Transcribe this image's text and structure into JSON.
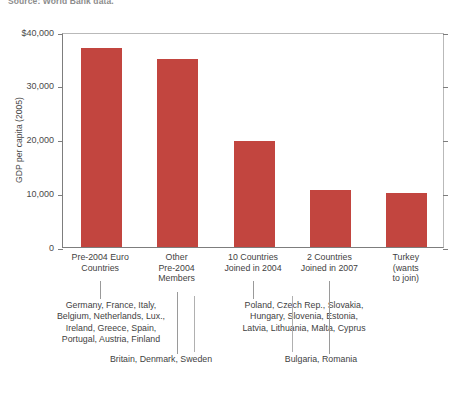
{
  "source": {
    "text": "Source: World Bank data."
  },
  "chart_data": {
    "type": "bar",
    "title": "",
    "subtitle": "",
    "xlabel": "",
    "ylabel": "GDP per capita (2005)",
    "ylim": [
      0,
      40000
    ],
    "grid": false,
    "legend": null,
    "bar_color": "#c2453f",
    "y_ticks": [
      {
        "value": 40000,
        "label": "$40,000"
      },
      {
        "value": 30000,
        "label": "30,000"
      },
      {
        "value": 20000,
        "label": "20,000"
      },
      {
        "value": 10000,
        "label": "10,000"
      },
      {
        "value": 0,
        "label": "0"
      }
    ],
    "categories": [
      "Pre-2004 Euro Countries",
      "Other Pre-2004 Members",
      "10 Countries Joined in 2004",
      "2 Countries Joined in 2007",
      "Turkey (wants to join)"
    ],
    "category_lines": [
      [
        "Pre-2004 Euro",
        "Countries"
      ],
      [
        "Other",
        "Pre-2004",
        "Members"
      ],
      [
        "10 Countries",
        "Joined in 2004"
      ],
      [
        "2 Countries",
        "Joined in 2007"
      ],
      [
        "Turkey",
        "(wants",
        "to join)"
      ]
    ],
    "values": [
      37000,
      35000,
      19800,
      10700,
      10000
    ]
  },
  "annotations": [
    {
      "name": "pre-2004-euro-countries-list",
      "lines": [
        "Germany, France, Italy,",
        "Belgium, Netherlands, Lux.,",
        "Ireland, Greece, Spain,",
        "Portugal, Austria, Finland"
      ]
    },
    {
      "name": "joined-2004-countries-list",
      "lines": [
        "Poland, Czech Rep., Slovakia,",
        "Hungary, Slovenia, Estonia,",
        "Latvia, Lithuania, Malta, Cyprus"
      ]
    },
    {
      "name": "other-pre-2004-members-list",
      "lines": [
        "Britain, Denmark, Sweden"
      ]
    },
    {
      "name": "joined-2007-countries-list",
      "lines": [
        "Bulgaria, Romania"
      ]
    }
  ]
}
